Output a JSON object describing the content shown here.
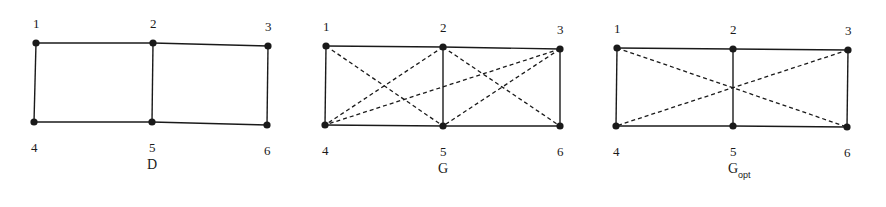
{
  "figure": {
    "graphs": [
      {
        "id": "D",
        "title": "D",
        "subscript": "",
        "nodes": [
          {
            "id": "1",
            "x": 36,
            "y": 43
          },
          {
            "id": "2",
            "x": 153,
            "y": 43
          },
          {
            "id": "3",
            "x": 268,
            "y": 46
          },
          {
            "id": "4",
            "x": 34,
            "y": 122
          },
          {
            "id": "5",
            "x": 152,
            "y": 122
          },
          {
            "id": "6",
            "x": 267,
            "y": 125
          }
        ],
        "solid_edges": [
          [
            "1",
            "2"
          ],
          [
            "2",
            "3"
          ],
          [
            "4",
            "5"
          ],
          [
            "5",
            "6"
          ],
          [
            "1",
            "4"
          ],
          [
            "2",
            "5"
          ],
          [
            "3",
            "6"
          ]
        ],
        "dashed_edges": []
      },
      {
        "id": "G",
        "title": "G",
        "subscript": "",
        "nodes": [
          {
            "id": "1",
            "x": 326,
            "y": 46
          },
          {
            "id": "2",
            "x": 443,
            "y": 47
          },
          {
            "id": "3",
            "x": 560,
            "y": 49
          },
          {
            "id": "4",
            "x": 325,
            "y": 125
          },
          {
            "id": "5",
            "x": 443,
            "y": 126
          },
          {
            "id": "6",
            "x": 560,
            "y": 126
          }
        ],
        "solid_edges": [
          [
            "1",
            "2"
          ],
          [
            "2",
            "3"
          ],
          [
            "4",
            "5"
          ],
          [
            "5",
            "6"
          ],
          [
            "1",
            "4"
          ],
          [
            "2",
            "5"
          ],
          [
            "3",
            "6"
          ]
        ],
        "dashed_edges": [
          [
            "1",
            "5"
          ],
          [
            "2",
            "4"
          ],
          [
            "3",
            "4"
          ],
          [
            "2",
            "6"
          ],
          [
            "3",
            "5"
          ]
        ]
      },
      {
        "id": "Gopt",
        "title": "G",
        "subscript": "opt",
        "nodes": [
          {
            "id": "1",
            "x": 617,
            "y": 48
          },
          {
            "id": "2",
            "x": 733,
            "y": 49
          },
          {
            "id": "3",
            "x": 848,
            "y": 50
          },
          {
            "id": "4",
            "x": 616,
            "y": 126
          },
          {
            "id": "5",
            "x": 733,
            "y": 126
          },
          {
            "id": "6",
            "x": 847,
            "y": 127
          }
        ],
        "solid_edges": [
          [
            "1",
            "2"
          ],
          [
            "2",
            "3"
          ],
          [
            "4",
            "5"
          ],
          [
            "5",
            "6"
          ],
          [
            "1",
            "4"
          ],
          [
            "2",
            "5"
          ],
          [
            "3",
            "6"
          ]
        ],
        "dashed_edges": [
          [
            "1",
            "6"
          ],
          [
            "3",
            "4"
          ]
        ]
      }
    ],
    "colors": {
      "ink": "#1a1a1a",
      "background": "#ffffff"
    }
  }
}
